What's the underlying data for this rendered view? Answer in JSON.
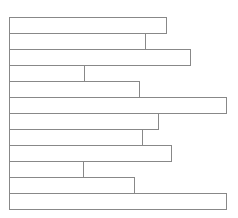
{
  "chart_data": {
    "type": "bar",
    "orientation": "horizontal",
    "title": "",
    "xlabel": "",
    "ylabel": "",
    "categories": [
      "",
      "",
      "",
      "",
      "",
      "",
      "",
      "",
      "",
      "",
      "",
      ""
    ],
    "values": [
      157,
      136,
      181,
      75,
      130,
      217,
      149,
      133,
      162,
      74,
      125,
      217
    ],
    "xlim": [
      0,
      217
    ],
    "grid": false,
    "legend": "none",
    "style": {
      "fill": "#ffffff",
      "stroke": "#888888"
    }
  }
}
